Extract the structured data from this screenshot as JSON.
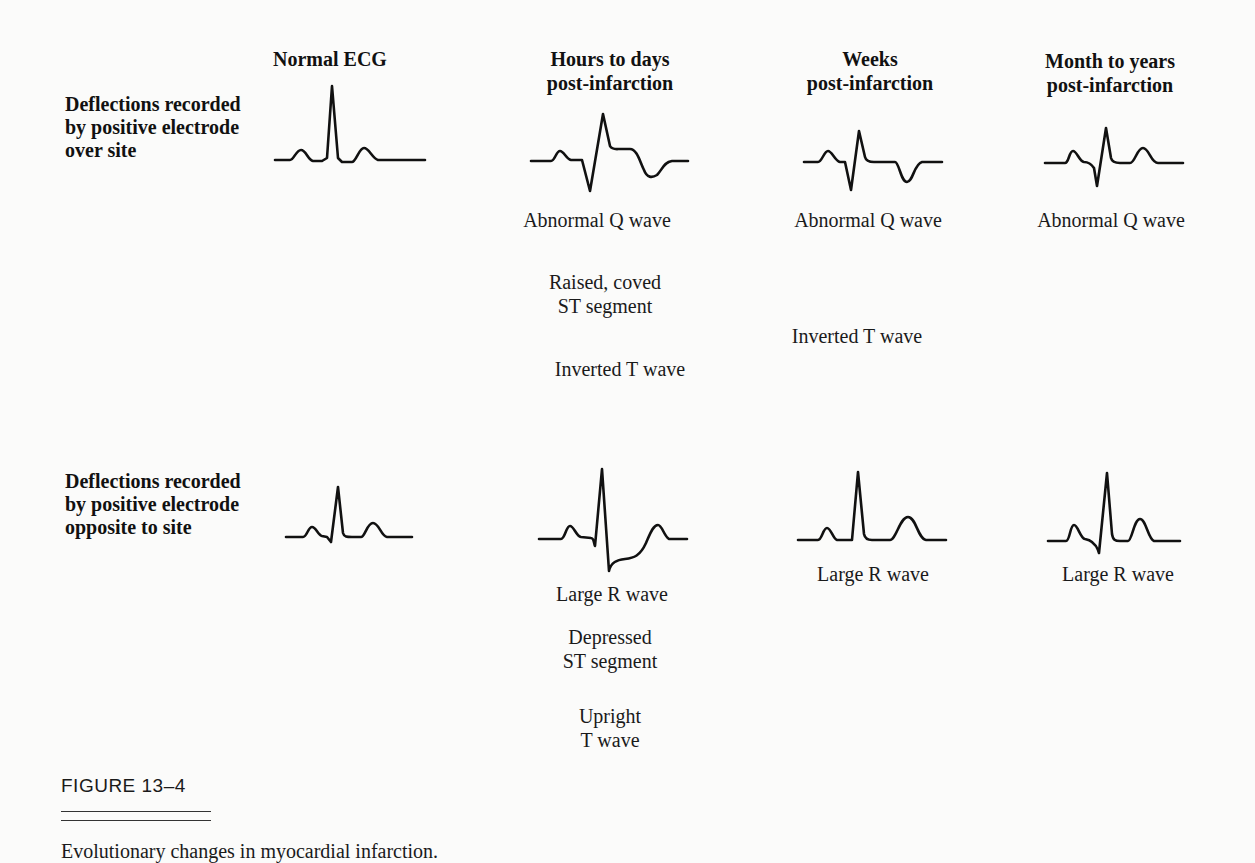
{
  "columns": [
    {
      "id": "normal",
      "label_lines": [
        "Normal ECG"
      ]
    },
    {
      "id": "hours",
      "label_lines": [
        "Hours to days",
        "post-infarction"
      ]
    },
    {
      "id": "weeks",
      "label_lines": [
        "Weeks",
        "post-infarction"
      ]
    },
    {
      "id": "months",
      "label_lines": [
        "Month to years",
        "post-infarction"
      ]
    }
  ],
  "rows": [
    {
      "id": "over_site",
      "label_lines": [
        "Deflections recorded",
        "by positive electrode",
        "over site"
      ],
      "annotations": {
        "hours": [
          "Abnormal Q wave",
          "Raised, coved",
          "ST segment",
          "Inverted T wave"
        ],
        "weeks": [
          "Abnormal Q wave",
          "Inverted T wave"
        ],
        "months": [
          "Abnormal Q wave"
        ]
      }
    },
    {
      "id": "opposite_site",
      "label_lines": [
        "Deflections recorded",
        "by positive electrode",
        "opposite to site"
      ],
      "annotations": {
        "hours": [
          "Large R wave",
          "Depressed",
          "ST segment",
          "Upright",
          "T wave"
        ],
        "weeks": [
          "Large R wave"
        ],
        "months": [
          "Large R wave"
        ]
      }
    }
  ],
  "figure": {
    "label": "FIGURE 13–4",
    "caption": "Evolutionary changes in myocardial infarction."
  },
  "waveforms": {
    "over_site": {
      "normal": "Normal P-QRS-T complex with tall R wave",
      "hours": "Abnormal Q wave, raised coved ST segment, inverted T wave",
      "weeks": "Abnormal Q wave, inverted T wave",
      "months": "Abnormal Q wave, upright T wave"
    },
    "opposite_site": {
      "normal": "Normal P-QRS-T complex",
      "hours": "Large R wave, depressed ST segment, upright T wave",
      "weeks": "Large R wave, upright T wave",
      "months": "Large R wave, upright T wave"
    }
  },
  "colors": {
    "ink": "#111111",
    "paper": "#fbfbfa"
  }
}
